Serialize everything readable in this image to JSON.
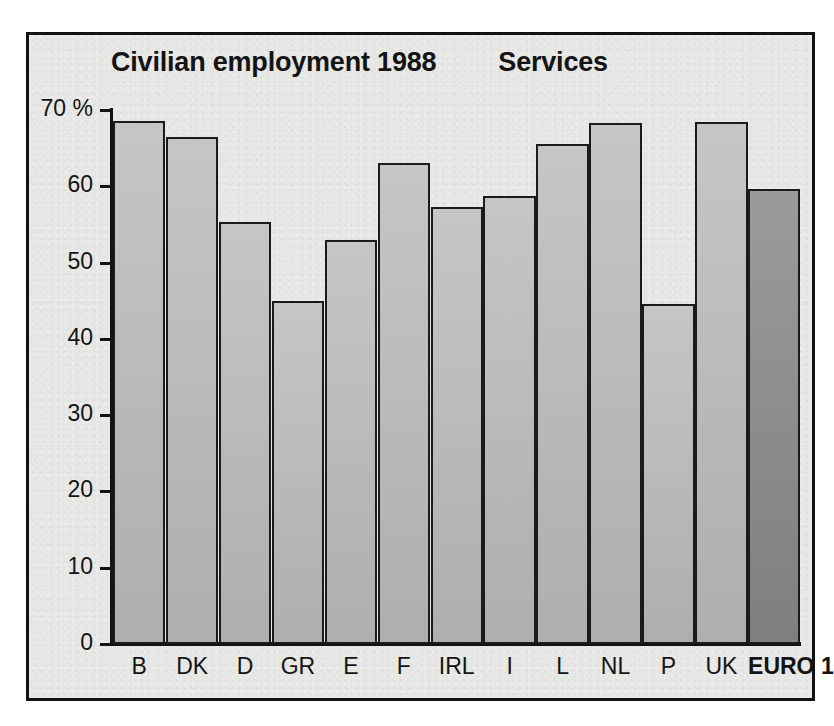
{
  "figure": {
    "title": "Civilian employment 1988",
    "subtitle": "Services"
  },
  "chart_data": {
    "type": "bar",
    "title": "Civilian employment 1988",
    "subtitle": "Services",
    "xlabel": "",
    "ylabel": "",
    "yunit": "%",
    "ylim": [
      0,
      70
    ],
    "yticks": [
      0,
      10,
      20,
      30,
      40,
      50,
      60,
      70
    ],
    "ytick_labels": [
      "0",
      "10",
      "20",
      "30",
      "40",
      "50",
      "60",
      "70 %"
    ],
    "grid": false,
    "legend": false,
    "categories": [
      "B",
      "DK",
      "D",
      "GR",
      "E",
      "F",
      "IRL",
      "I",
      "L",
      "NL",
      "P",
      "UK",
      "EURO 12"
    ],
    "values": [
      68.5,
      66.5,
      55.3,
      45.0,
      53.0,
      63.0,
      57.3,
      58.7,
      65.6,
      68.3,
      44.6,
      68.4,
      59.6
    ],
    "highlight_category": "EURO 12",
    "colors": {
      "bar_fill": "#b9b9b9",
      "bar_highlight_fill": "#8d8d8d",
      "bar_stroke": "#1b1b1b",
      "axis": "#121212",
      "background": "#e8e8e6",
      "text": "#141414"
    }
  }
}
